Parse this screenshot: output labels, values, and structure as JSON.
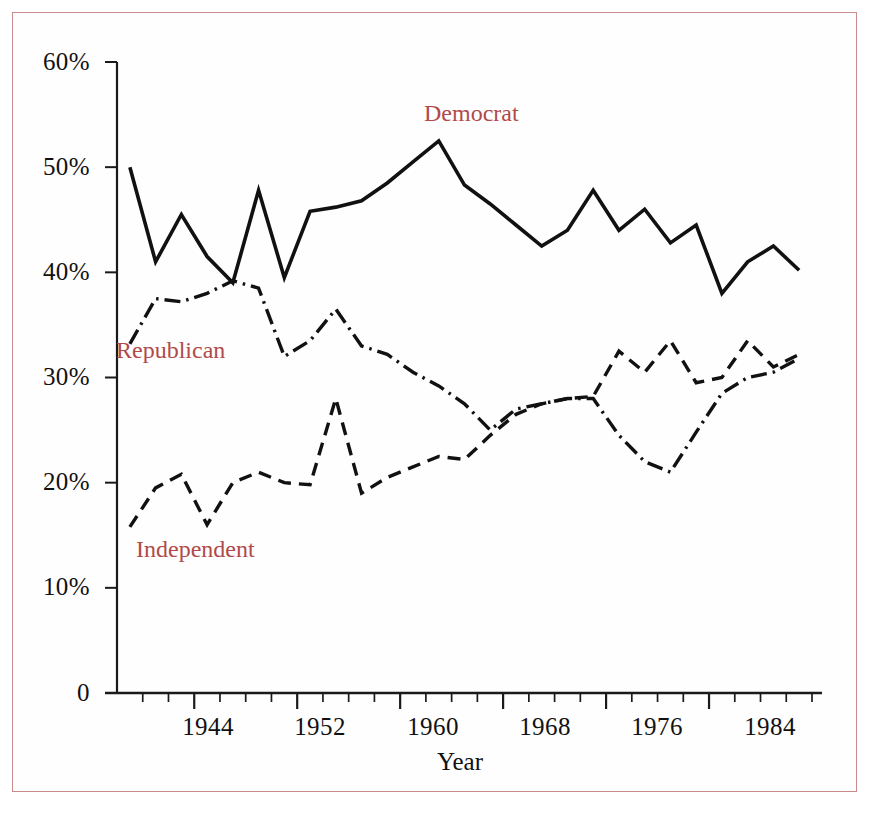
{
  "figure": {
    "border_color": "#c98b8b",
    "background": "#ffffff",
    "label_color": "#b04a4a",
    "line_color": "#111111"
  },
  "axis": {
    "x_title": "Year",
    "y_ticks": [
      "60%",
      "50%",
      "40%",
      "30%",
      "20%",
      "10%",
      "0"
    ],
    "x_ticks": [
      "1944",
      "1952",
      "1960",
      "1968",
      "1976",
      "1984"
    ]
  },
  "labels": {
    "democrat": "Democrat",
    "republican": "Republican",
    "independent": "Independent"
  },
  "caption": "",
  "chart_data": {
    "type": "line",
    "title": "",
    "xlabel": "Year",
    "ylabel": "",
    "xlim": [
      1938,
      1992
    ],
    "ylim": [
      0,
      60
    ],
    "ytick_values": [
      0,
      10,
      20,
      30,
      40,
      50,
      60
    ],
    "ytick_labels": [
      "0",
      "10%",
      "20%",
      "30%",
      "40%",
      "50%",
      "60%"
    ],
    "xtick_values": [
      1944,
      1952,
      1960,
      1968,
      1976,
      1984
    ],
    "xtick_minor_step": 2,
    "grid": false,
    "legend": "inline-annotations",
    "x": [
      1939,
      1941,
      1943,
      1945,
      1947,
      1949,
      1951,
      1953,
      1955,
      1957,
      1959,
      1961,
      1963,
      1965,
      1967,
      1969,
      1971,
      1973,
      1975,
      1977,
      1979,
      1981,
      1983,
      1985,
      1987,
      1989,
      1991
    ],
    "series": [
      {
        "name": "Democrat",
        "style": "solid",
        "values": [
          50.0,
          41.0,
          45.5,
          41.5,
          39.0,
          47.8,
          39.5,
          45.8,
          46.2,
          46.8,
          48.5,
          50.5,
          52.5,
          48.3,
          46.5,
          44.5,
          42.5,
          44.0,
          47.8,
          44.0,
          46.0,
          42.8,
          44.5,
          38.0,
          41.0,
          42.5,
          40.2
        ]
      },
      {
        "name": "Republican",
        "style": "dash-dot",
        "values": [
          33.2,
          37.5,
          37.2,
          38.0,
          39.2,
          38.5,
          32.0,
          33.5,
          36.5,
          33.0,
          32.2,
          30.5,
          29.2,
          27.5,
          25.0,
          27.0,
          27.5,
          28.0,
          28.0,
          24.5,
          22.0,
          21.0,
          24.8,
          28.5,
          30.0,
          30.5,
          31.8
        ]
      },
      {
        "name": "Independent",
        "style": "dashed",
        "values": [
          15.8,
          19.5,
          20.8,
          16.0,
          20.0,
          21.0,
          20.0,
          19.8,
          28.0,
          19.0,
          20.5,
          21.5,
          22.5,
          22.2,
          24.5,
          26.5,
          27.5,
          28.0,
          28.2,
          32.5,
          30.5,
          33.5,
          29.5,
          30.0,
          33.5,
          31.0,
          32.2
        ]
      }
    ]
  }
}
